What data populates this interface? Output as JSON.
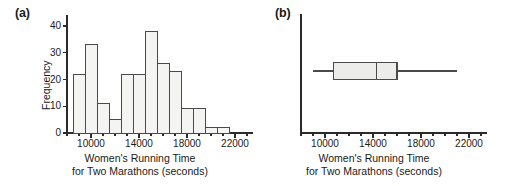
{
  "figure": {
    "panels": [
      {
        "tag": "(a)",
        "type": "histogram"
      },
      {
        "tag": "(b)",
        "type": "boxplot"
      }
    ]
  },
  "chart_data": [
    {
      "type": "bar",
      "panel": "(a)",
      "title": "",
      "xlabel_line1": "Women's Running Time",
      "xlabel_line2": "for Two Marathons (seconds)",
      "ylabel": "Frequency",
      "xlim": [
        8000,
        23000
      ],
      "ylim": [
        0,
        43
      ],
      "xticks": [
        10000,
        14000,
        18000,
        22000
      ],
      "xtick_labels": [
        "10000",
        "14000",
        "18000",
        "22000"
      ],
      "xticks_minor": [
        8000,
        9000,
        10000,
        11000,
        12000,
        13000,
        14000,
        15000,
        16000,
        17000,
        18000,
        19000,
        20000,
        21000,
        22000,
        23000
      ],
      "yticks": [
        0,
        10,
        20,
        30,
        40
      ],
      "ytick_labels": [
        "0",
        "10",
        "20",
        "30",
        "40"
      ],
      "grid": false,
      "legend": "none",
      "bin_width": 1000,
      "bin_edges": [
        8500,
        9500,
        10500,
        11500,
        12500,
        13500,
        14500,
        15500,
        16500,
        17500,
        18500,
        19500,
        20500,
        21500
      ],
      "categories": [
        "8500-9500",
        "9500-10500",
        "10500-11500",
        "11500-12500",
        "12500-13500",
        "13500-14500",
        "14500-15500",
        "15500-16500",
        "16500-17500",
        "17500-18500",
        "18500-19500",
        "19500-20500",
        "20500-21500"
      ],
      "values": [
        22,
        33,
        11,
        5,
        22,
        22,
        38,
        26,
        23,
        9,
        9,
        2,
        2
      ]
    },
    {
      "type": "boxplot",
      "panel": "(b)",
      "title": "",
      "xlabel_line1": "Women's Running Time",
      "xlabel_line2": "for Two Marathons (seconds)",
      "ylabel": "",
      "xlim": [
        8000,
        23000
      ],
      "xticks": [
        10000,
        14000,
        18000,
        22000
      ],
      "xtick_labels": [
        "10000",
        "14000",
        "18000",
        "22000"
      ],
      "xticks_minor": [
        8000,
        9000,
        10000,
        11000,
        12000,
        13000,
        14000,
        15000,
        16000,
        17000,
        18000,
        19000,
        20000,
        21000,
        22000,
        23000
      ],
      "grid": false,
      "legend": "none",
      "box": {
        "min": 9000,
        "q1": 10700,
        "median": 14300,
        "q3": 16000,
        "max": 21000
      }
    }
  ]
}
